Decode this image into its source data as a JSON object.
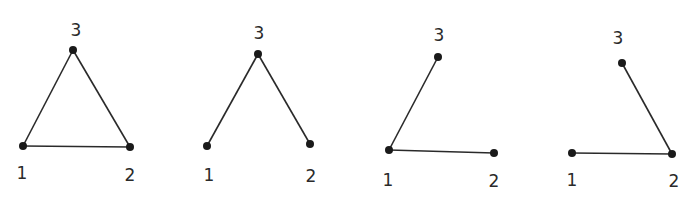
{
  "figure": {
    "graphs": [
      {
        "id": "g1",
        "nodes": [
          {
            "label": "1",
            "x": 23,
            "y": 146,
            "lx": 22,
            "ly": 179
          },
          {
            "label": "2",
            "x": 130,
            "y": 147,
            "lx": 130,
            "ly": 181
          },
          {
            "label": "3",
            "x": 73,
            "y": 50,
            "lx": 76,
            "ly": 36
          }
        ],
        "edges": [
          [
            "1",
            "2"
          ],
          [
            "1",
            "3"
          ],
          [
            "2",
            "3"
          ]
        ]
      },
      {
        "id": "g2",
        "nodes": [
          {
            "label": "1",
            "x": 207,
            "y": 146,
            "lx": 209,
            "ly": 181
          },
          {
            "label": "2",
            "x": 310,
            "y": 144,
            "lx": 311,
            "ly": 182
          },
          {
            "label": "3",
            "x": 258,
            "y": 54,
            "lx": 259,
            "ly": 39
          }
        ],
        "edges": [
          [
            "1",
            "3"
          ],
          [
            "2",
            "3"
          ]
        ]
      },
      {
        "id": "g3",
        "nodes": [
          {
            "label": "1",
            "x": 389,
            "y": 150,
            "lx": 388,
            "ly": 186
          },
          {
            "label": "2",
            "x": 494,
            "y": 153,
            "lx": 494,
            "ly": 187
          },
          {
            "label": "3",
            "x": 438,
            "y": 57,
            "lx": 439,
            "ly": 41
          }
        ],
        "edges": [
          [
            "1",
            "2"
          ],
          [
            "1",
            "3"
          ]
        ]
      },
      {
        "id": "g4",
        "nodes": [
          {
            "label": "1",
            "x": 572,
            "y": 153,
            "lx": 572,
            "ly": 186
          },
          {
            "label": "2",
            "x": 672,
            "y": 154,
            "lx": 674,
            "ly": 187
          },
          {
            "label": "3",
            "x": 622,
            "y": 63,
            "lx": 618,
            "ly": 44
          }
        ],
        "edges": [
          [
            "1",
            "2"
          ],
          [
            "2",
            "3"
          ]
        ]
      }
    ],
    "colors": {
      "ink": "#2a2a2a",
      "node": "#1a1a1a",
      "background": "#ffffff"
    }
  }
}
